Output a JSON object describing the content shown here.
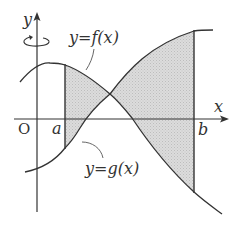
{
  "figure": {
    "type": "area-between-curves",
    "labels": {
      "y_axis": "y",
      "x_axis": "x",
      "origin": "O",
      "a": "a",
      "b": "b",
      "f_curve": "y=f(x)",
      "g_curve": "y=g(x)"
    },
    "rotation_indicator": "rotation-about-y-axis",
    "colors": {
      "line": "#333333",
      "shade": "#d4d4d4",
      "background": "#ffffff"
    }
  }
}
